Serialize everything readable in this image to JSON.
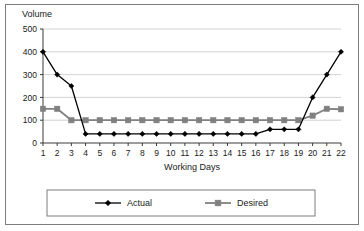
{
  "chart_data": {
    "type": "line",
    "title": "",
    "xlabel": "Working Days",
    "ylabel": "Volume",
    "ylabel_position": "top-left",
    "x": [
      1,
      2,
      3,
      4,
      5,
      6,
      7,
      8,
      9,
      10,
      11,
      12,
      13,
      14,
      15,
      16,
      17,
      18,
      19,
      20,
      21,
      22
    ],
    "categories": [
      "1",
      "2",
      "3",
      "4",
      "5",
      "6",
      "7",
      "8",
      "9",
      "10",
      "11",
      "12",
      "13",
      "14",
      "15",
      "16",
      "17",
      "18",
      "19",
      "20",
      "21",
      "22"
    ],
    "series": [
      {
        "name": "Actual",
        "color": "#000000",
        "marker": "diamond",
        "values": [
          400,
          300,
          250,
          40,
          40,
          40,
          40,
          40,
          40,
          40,
          40,
          40,
          40,
          40,
          40,
          40,
          60,
          60,
          60,
          200,
          300,
          400
        ]
      },
      {
        "name": "Desired",
        "color": "#808080",
        "marker": "square",
        "values": [
          150,
          150,
          100,
          100,
          100,
          100,
          100,
          100,
          100,
          100,
          100,
          100,
          100,
          100,
          100,
          100,
          100,
          100,
          100,
          120,
          150,
          148
        ]
      }
    ],
    "xlim": [
      1,
      22
    ],
    "ylim": [
      0,
      500
    ],
    "yticks": [
      0,
      100,
      200,
      300,
      400,
      500
    ],
    "ytick_labels": [
      "0",
      "100",
      "200",
      "300",
      "400",
      "500"
    ],
    "grid": "horizontal",
    "grid_color": "#c8c8c8",
    "legend_position": "bottom",
    "legend": [
      "Actual",
      "Desired"
    ],
    "plot_background": "#ffffff",
    "border_color": "#7d7d7d"
  }
}
